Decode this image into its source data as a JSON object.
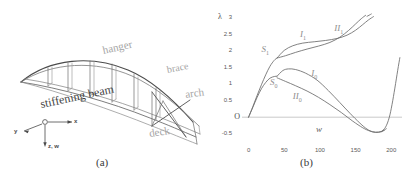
{
  "figure": {
    "panel_a": {
      "caption": "(a)",
      "labels": {
        "hanger": "hanger",
        "brace": "brace",
        "arch": "arch",
        "deck": "deck",
        "stiffening_beam": "stiffening beam"
      },
      "axes": {
        "x": "x",
        "y": "y",
        "zw": "z, w"
      }
    },
    "panel_b": {
      "caption": "(b)"
    }
  },
  "chart_data": {
    "type": "line",
    "title": "",
    "xlabel": "w",
    "ylabel": "λ",
    "xlim": [
      -12,
      215
    ],
    "ylim": [
      -0.72,
      3.12
    ],
    "xticks": [
      0,
      50,
      100,
      150,
      200
    ],
    "xtick_labels": [
      "0",
      "50",
      "100",
      "150",
      "200"
    ],
    "yticks": [
      -0.5,
      0,
      0.5,
      1,
      1.5,
      2,
      2.5,
      3
    ],
    "ytick_labels": [
      "-0.5",
      "O",
      "0.5",
      "1",
      "1.5",
      "2",
      "2.5",
      "3"
    ],
    "grid": false,
    "legend": "inline-annotations",
    "zero_line": true,
    "annotations": [
      {
        "text": "S",
        "sub": "1",
        "x": 18,
        "y": 2.02
      },
      {
        "text": "I",
        "sub": "1",
        "x": 72,
        "y": 2.47
      },
      {
        "text": "II",
        "sub": "1",
        "x": 120,
        "y": 2.68
      },
      {
        "text": "S",
        "sub": "0",
        "x": 30,
        "y": 1.02
      },
      {
        "text": "I",
        "sub": "0",
        "x": 88,
        "y": 1.32
      },
      {
        "text": "II",
        "sub": "0",
        "x": 62,
        "y": 0.6
      }
    ],
    "series": [
      {
        "name": "S0",
        "comment": "primary fundamental path, rises from origin",
        "points": [
          [
            0,
            0
          ],
          [
            6,
            0.3
          ],
          [
            12,
            0.6
          ],
          [
            18,
            0.86
          ],
          [
            24,
            1.05
          ],
          [
            30,
            1.18
          ],
          [
            36,
            1.23
          ],
          [
            40,
            1.24
          ]
        ]
      },
      {
        "name": "S1",
        "comment": "fundamental path continuing to upper branch",
        "points": [
          [
            0,
            0
          ],
          [
            6,
            0.32
          ],
          [
            12,
            0.66
          ],
          [
            18,
            0.98
          ],
          [
            24,
            1.28
          ],
          [
            30,
            1.54
          ],
          [
            36,
            1.72
          ],
          [
            40,
            1.79
          ]
        ]
      },
      {
        "name": "I0",
        "comment": "lower bifurcated branch I, peaks near w=50 then falls",
        "points": [
          [
            40,
            1.24
          ],
          [
            48,
            1.41
          ],
          [
            56,
            1.46
          ],
          [
            66,
            1.44
          ],
          [
            80,
            1.33
          ],
          [
            96,
            1.12
          ],
          [
            112,
            0.8
          ],
          [
            128,
            0.44
          ],
          [
            142,
            0.12
          ],
          [
            156,
            -0.18
          ],
          [
            166,
            -0.36
          ],
          [
            174,
            -0.44
          ],
          [
            182,
            -0.45
          ],
          [
            190,
            -0.4
          ]
        ]
      },
      {
        "name": "II0",
        "comment": "lower bifurcated branch II, shallower descent",
        "points": [
          [
            40,
            1.19
          ],
          [
            52,
            1.08
          ],
          [
            66,
            0.95
          ],
          [
            82,
            0.79
          ],
          [
            98,
            0.6
          ],
          [
            114,
            0.38
          ],
          [
            130,
            0.14
          ],
          [
            146,
            -0.12
          ],
          [
            160,
            -0.32
          ],
          [
            170,
            -0.42
          ],
          [
            178,
            -0.46
          ],
          [
            186,
            -0.44
          ],
          [
            193,
            -0.35
          ]
        ]
      },
      {
        "name": "II0-tail",
        "comment": "steeply rising tail at right edge",
        "points": [
          [
            186,
            -0.44
          ],
          [
            192,
            -0.3
          ],
          [
            197,
            -0.02
          ],
          [
            201,
            0.38
          ],
          [
            205,
            0.88
          ],
          [
            209,
            1.42
          ],
          [
            212,
            1.8
          ]
        ]
      },
      {
        "name": "I1",
        "comment": "upper bifurcated branch I, loop upper edge",
        "points": [
          [
            40,
            1.79
          ],
          [
            50,
            2.02
          ],
          [
            62,
            2.16
          ],
          [
            76,
            2.24
          ],
          [
            92,
            2.28
          ],
          [
            108,
            2.32
          ],
          [
            124,
            2.38
          ],
          [
            138,
            2.48
          ],
          [
            150,
            2.63
          ],
          [
            160,
            2.8
          ],
          [
            168,
            2.94
          ],
          [
            175,
            3.04
          ]
        ]
      },
      {
        "name": "II1",
        "comment": "upper bifurcated branch II, loop lower edge",
        "points": [
          [
            40,
            1.79
          ],
          [
            52,
            1.86
          ],
          [
            66,
            1.96
          ],
          [
            82,
            2.06
          ],
          [
            98,
            2.15
          ],
          [
            114,
            2.26
          ],
          [
            128,
            2.42
          ],
          [
            140,
            2.62
          ],
          [
            150,
            2.82
          ],
          [
            158,
            2.98
          ],
          [
            164,
            3.08
          ]
        ]
      },
      {
        "name": "I1-tail",
        "comment": "thin continuation above 3 toward top right",
        "points": [
          [
            166,
            3.05
          ],
          [
            172,
            3.12
          ]
        ]
      }
    ]
  }
}
